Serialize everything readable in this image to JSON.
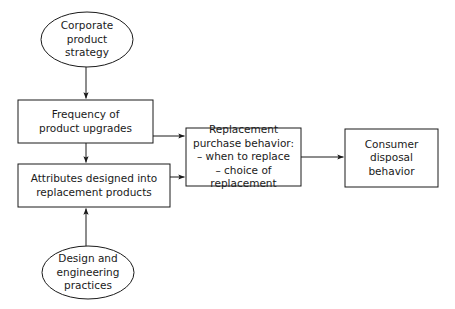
{
  "diagram": {
    "background_color": "#ffffff",
    "stroke_color": "#1a1a1a",
    "text_color": "#1a1a1a",
    "nodes": [
      {
        "id": "corporate_strategy",
        "shape": "ellipse",
        "label": "Corporate\nproduct\nstrategy",
        "x": 41,
        "y": 12,
        "width": 92,
        "height": 55
      },
      {
        "id": "frequency_upgrades",
        "shape": "rectangle",
        "label": "Frequency of\nproduct upgrades",
        "x": 18,
        "y": 100,
        "width": 135,
        "height": 43
      },
      {
        "id": "attributes_designed",
        "shape": "rectangle",
        "label": "Attributes designed into\nreplacement  products",
        "x": 18,
        "y": 164,
        "width": 152,
        "height": 43
      },
      {
        "id": "design_practices",
        "shape": "ellipse",
        "label": "Design and\nengineering\npractices",
        "x": 42,
        "y": 246,
        "width": 92,
        "height": 53
      },
      {
        "id": "replacement_behavior",
        "shape": "rectangle",
        "label": "Replacement\npurchase behavior:\n– when to replace\n– choice of replacement",
        "x": 186,
        "y": 128,
        "width": 115,
        "height": 58
      },
      {
        "id": "consumer_disposal",
        "shape": "rectangle",
        "label": "Consumer\ndisposal\nbehavior",
        "x": 345,
        "y": 129,
        "width": 93,
        "height": 58
      }
    ],
    "edges": [
      {
        "id": "corporate_to_frequency",
        "from": "corporate_strategy",
        "to": "frequency_upgrades",
        "direction": "down"
      },
      {
        "id": "frequency_to_attributes",
        "from": "frequency_upgrades",
        "to": "attributes_designed",
        "direction": "down"
      },
      {
        "id": "design_to_attributes",
        "from": "design_practices",
        "to": "attributes_designed",
        "direction": "up"
      },
      {
        "id": "frequency_to_replacement",
        "from": "frequency_upgrades",
        "to": "replacement_behavior",
        "direction": "right"
      },
      {
        "id": "attributes_to_replacement",
        "from": "attributes_designed",
        "to": "replacement_behavior",
        "direction": "right"
      },
      {
        "id": "replacement_to_disposal",
        "from": "replacement_behavior",
        "to": "consumer_disposal",
        "direction": "right"
      }
    ]
  }
}
